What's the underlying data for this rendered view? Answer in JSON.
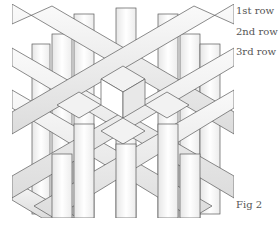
{
  "figure": {
    "labels": {
      "row1": "1st row",
      "row2": "2nd row",
      "row3": "3rd row"
    },
    "caption": "Fig 2"
  },
  "colors": {
    "background": "#ffffff",
    "strip_fill": "#f4f4f4",
    "strip_shade": "#dddddd",
    "edge": "#555555",
    "text": "#555555"
  }
}
